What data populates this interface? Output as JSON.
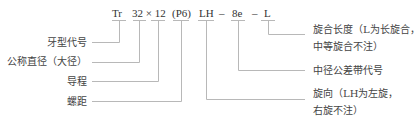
{
  "code": {
    "tr": "Tr",
    "size": "32 × 12",
    "pitch": "(P6)",
    "hand": "LH",
    "dash1": "–",
    "tolerance": "8e",
    "dash2": "–",
    "length": "L"
  },
  "labels_left": {
    "thread_type": "牙型代号",
    "nominal_diameter": "公称直径（大径）",
    "lead": "导程",
    "pitch": "螺距"
  },
  "labels_right": {
    "engagement_length_line1": "旋合长度（L为长旋合，",
    "engagement_length_line2": "中等旋合不注）",
    "pitch_diameter_tolerance": "中径公差带代号",
    "direction_line1": "旋向（LH为左旋，",
    "direction_line2": "右旋不注）"
  },
  "colors": {
    "line": "#b8b8b8",
    "text": "#444444"
  }
}
